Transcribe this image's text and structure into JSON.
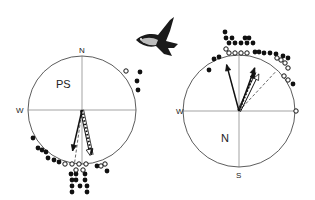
{
  "figure": {
    "bird_icon": "flying-bird-icon",
    "panels": [
      {
        "id": "left",
        "label": "PS",
        "cardinals": {
          "north": "N",
          "west": "W"
        },
        "center": [
          82,
          110
        ],
        "radius": 54,
        "filled_dots": [
          [
            140,
            72
          ],
          [
            137,
            81
          ],
          [
            138,
            90
          ],
          [
            33,
            138
          ],
          [
            38,
            148
          ],
          [
            42,
            150
          ],
          [
            46,
            152
          ],
          [
            48,
            158
          ],
          [
            54,
            160
          ],
          [
            59,
            162
          ],
          [
            71,
            174
          ],
          [
            76,
            174
          ],
          [
            85,
            174
          ],
          [
            72,
            180
          ],
          [
            76,
            180
          ],
          [
            85,
            180
          ],
          [
            72,
            186
          ],
          [
            80,
            186
          ],
          [
            87,
            186
          ],
          [
            72,
            192
          ],
          [
            87,
            192
          ],
          [
            97,
            166
          ],
          [
            107,
            171
          ]
        ],
        "open_dots": [
          [
            126,
            71
          ],
          [
            65,
            164
          ],
          [
            72,
            164
          ],
          [
            79,
            164
          ],
          [
            86,
            164
          ],
          [
            76,
            170
          ],
          [
            83,
            170
          ],
          [
            101,
            166
          ],
          [
            105,
            164
          ]
        ],
        "arrows": [
          {
            "style": "solid",
            "angle_deg": 193,
            "length": 42
          },
          {
            "style": "dotted",
            "angle_deg": 168,
            "length": 46
          },
          {
            "style": "double",
            "angle_deg": 168,
            "length": 46
          }
        ],
        "mean_line": {
          "style": "dashed",
          "angle_deg": 188,
          "length": 54
        }
      },
      {
        "id": "right",
        "label": "N",
        "cardinals": {
          "north": "",
          "west": "W",
          "south": "S"
        },
        "center": [
          239,
          111
        ],
        "radius": 56,
        "filled_dots": [
          [
            225,
            32
          ],
          [
            226,
            38
          ],
          [
            232,
            38
          ],
          [
            245,
            38
          ],
          [
            249,
            38
          ],
          [
            229,
            43
          ],
          [
            235,
            43
          ],
          [
            241,
            43
          ],
          [
            247,
            43
          ],
          [
            253,
            43
          ],
          [
            255,
            52
          ],
          [
            259,
            52
          ],
          [
            264,
            53
          ],
          [
            270,
            53
          ],
          [
            276,
            54
          ],
          [
            283,
            56
          ],
          [
            288,
            58
          ],
          [
            209,
            70
          ],
          [
            214,
            59
          ],
          [
            219,
            57
          ],
          [
            293,
            84
          ]
        ],
        "open_dots": [
          [
            226,
            49
          ],
          [
            229,
            53
          ],
          [
            235,
            53
          ],
          [
            241,
            53
          ],
          [
            247,
            53
          ],
          [
            281,
            60
          ],
          [
            285,
            63
          ],
          [
            277,
            58
          ],
          [
            288,
            68
          ],
          [
            284,
            76
          ],
          [
            288,
            80
          ],
          [
            296,
            111
          ]
        ],
        "arrows": [
          {
            "style": "solid",
            "angle_deg": 345,
            "length": 48
          },
          {
            "style": "solid",
            "angle_deg": 20,
            "length": 46
          },
          {
            "style": "dotted",
            "angle_deg": 22,
            "length": 42
          },
          {
            "style": "double",
            "angle_deg": 26,
            "length": 42
          }
        ],
        "mean_line": {
          "style": "dashed",
          "angle_deg": 43,
          "length": 54
        }
      }
    ]
  }
}
